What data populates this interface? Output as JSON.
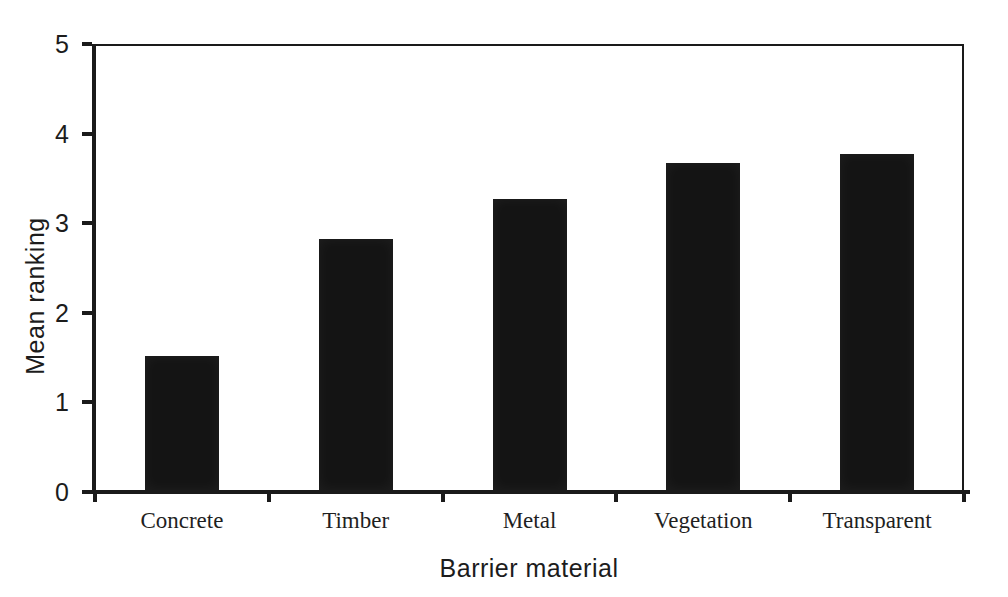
{
  "figure": {
    "background_color": "#ffffff",
    "axis_color": "#1a1a1a",
    "text_color": "#1c1c1c"
  },
  "chart_data": {
    "type": "bar",
    "title": "",
    "categories": [
      "Concrete",
      "Timber",
      "Metal",
      "Vegetation",
      "Transparent"
    ],
    "values": [
      1.5,
      2.8,
      3.25,
      3.65,
      3.75
    ],
    "xlabel": "Barrier material",
    "ylabel": "Mean ranking",
    "ylim": [
      0,
      5
    ],
    "yticks": [
      0,
      1,
      2,
      3,
      4,
      5
    ],
    "grid": false,
    "legend": false,
    "bar_color": "#141414"
  }
}
